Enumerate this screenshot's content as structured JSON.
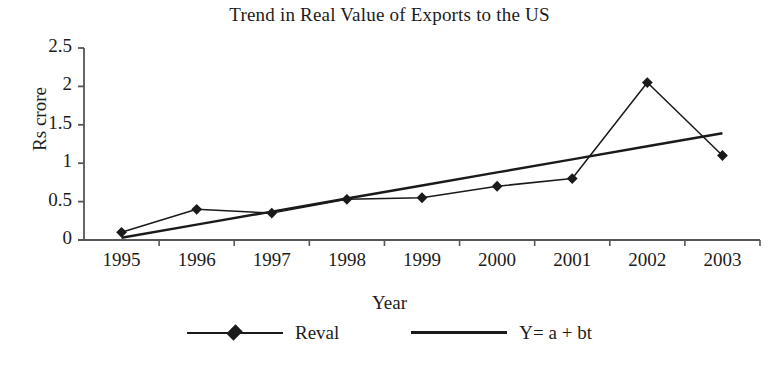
{
  "chart_data": {
    "type": "line",
    "title": "Trend in Real Value of Exports to the US",
    "xlabel": "Year",
    "ylabel": "Rs crore",
    "categories": [
      "1995",
      "1996",
      "1997",
      "1998",
      "1999",
      "2000",
      "2001",
      "2002",
      "2003"
    ],
    "x": [
      1995,
      1996,
      1997,
      1998,
      1999,
      2000,
      2001,
      2002,
      2003
    ],
    "ylim": [
      0,
      2.5
    ],
    "yticks": [
      "0",
      "0.5",
      "1",
      "1.5",
      "2",
      "2.5"
    ],
    "ytick_values": [
      0,
      0.5,
      1,
      1.5,
      2,
      2.5
    ],
    "grid": false,
    "legend_position": "bottom",
    "series": [
      {
        "name": "Reval",
        "marker": "diamond",
        "line_width": "thin",
        "color": "#1a1a1a",
        "values": [
          0.1,
          0.4,
          0.35,
          0.53,
          0.55,
          0.7,
          0.8,
          2.05,
          1.1
        ]
      },
      {
        "name": "Y= a + bt",
        "marker": "none",
        "line_width": "thick",
        "color": "#1a1a1a",
        "values": [
          0.03,
          0.2,
          0.37,
          0.54,
          0.71,
          0.88,
          1.05,
          1.22,
          1.39
        ]
      }
    ]
  },
  "legend": {
    "entries": [
      {
        "label": "Reval"
      },
      {
        "label": "Y= a + bt"
      }
    ]
  }
}
